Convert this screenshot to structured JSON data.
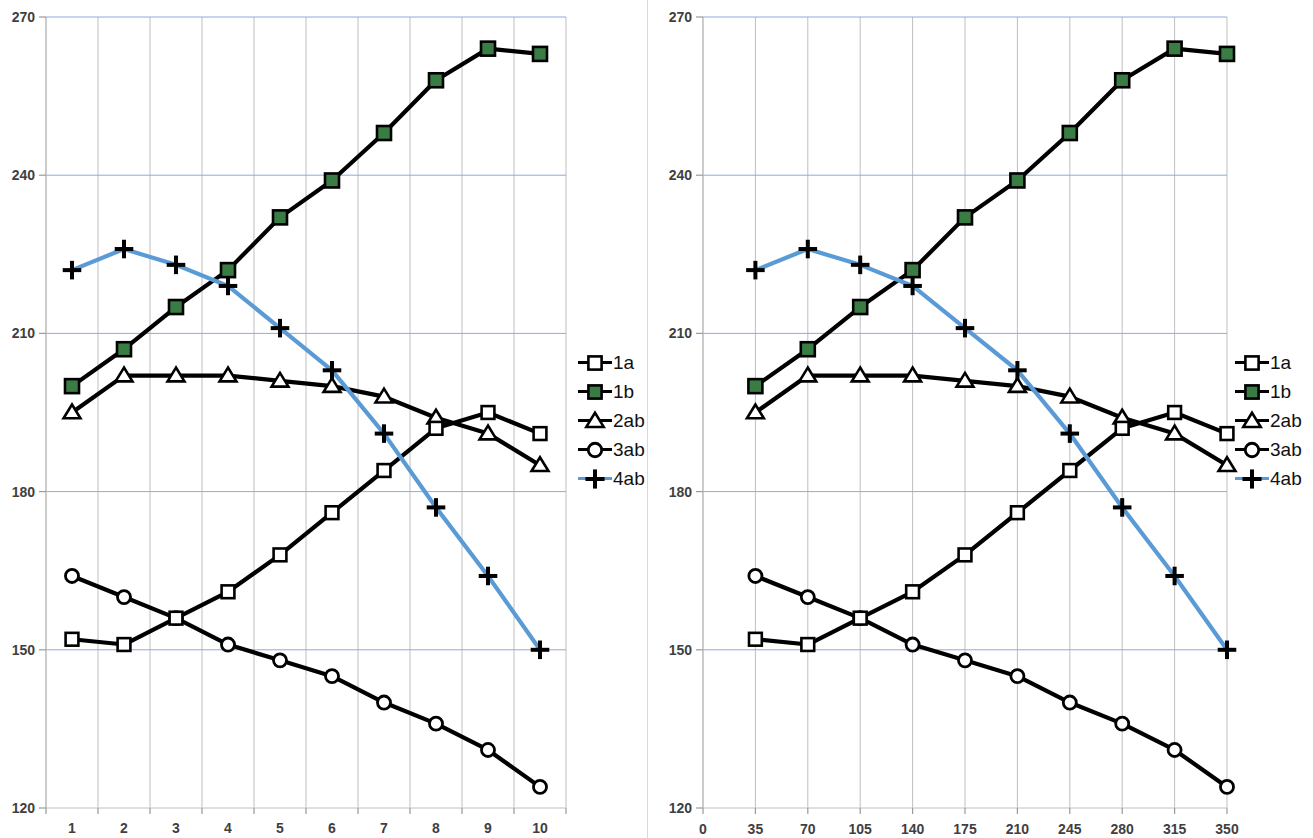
{
  "chart_data": [
    {
      "id": "left-chart",
      "type": "line",
      "title": "",
      "xlabel": "",
      "ylabel": "",
      "x_axis_type": "category",
      "categories": [
        "1",
        "2",
        "3",
        "4",
        "5",
        "6",
        "7",
        "8",
        "9",
        "10"
      ],
      "xtick_labels": [
        "1",
        "2",
        "3",
        "4",
        "5",
        "6",
        "7",
        "8",
        "9",
        "10"
      ],
      "xlim": [
        0.5,
        10.5
      ],
      "ylim": [
        120,
        270
      ],
      "ytick_labels": [
        "120",
        "150",
        "180",
        "210",
        "240",
        "270"
      ],
      "yticks": [
        120,
        150,
        180,
        210,
        240,
        270
      ],
      "grid": "both",
      "legend_position": "right",
      "series": [
        {
          "name": "1a",
          "marker": "open-square",
          "color": "#000000",
          "values": [
            152,
            151,
            156,
            161,
            168,
            176,
            184,
            192,
            195,
            191
          ]
        },
        {
          "name": "1b",
          "marker": "filled-square",
          "color": "#000000",
          "marker_fill": "#3a7d44",
          "values": [
            200,
            207,
            215,
            222,
            232,
            239,
            248,
            258,
            264,
            263
          ]
        },
        {
          "name": "2ab",
          "marker": "open-triangle",
          "color": "#000000",
          "values": [
            195,
            202,
            202,
            202,
            201,
            200,
            198,
            194,
            191,
            185
          ]
        },
        {
          "name": "3ab",
          "marker": "open-circle",
          "color": "#000000",
          "values": [
            164,
            160,
            156,
            151,
            148,
            145,
            140,
            136,
            131,
            124
          ]
        },
        {
          "name": "4ab",
          "marker": "plus",
          "color": "#5b9bd5",
          "values": [
            222,
            226,
            223,
            219,
            211,
            203,
            191,
            177,
            164,
            150
          ]
        }
      ]
    },
    {
      "id": "right-chart",
      "type": "line",
      "title": "",
      "xlabel": "",
      "ylabel": "",
      "x_axis_type": "numeric",
      "x": [
        35,
        70,
        105,
        140,
        175,
        210,
        245,
        280,
        315,
        350
      ],
      "xtick_labels": [
        "0",
        "35",
        "70",
        "105",
        "140",
        "175",
        "210",
        "245",
        "280",
        "315",
        "350"
      ],
      "xticks": [
        0,
        35,
        70,
        105,
        140,
        175,
        210,
        245,
        280,
        315,
        350
      ],
      "xlim": [
        0,
        350
      ],
      "ylim": [
        120,
        270
      ],
      "ytick_labels": [
        "120",
        "150",
        "180",
        "210",
        "240",
        "270"
      ],
      "yticks": [
        120,
        150,
        180,
        210,
        240,
        270
      ],
      "grid": "both",
      "legend_position": "right",
      "series": [
        {
          "name": "1a",
          "marker": "open-square",
          "color": "#000000",
          "values": [
            152,
            151,
            156,
            161,
            168,
            176,
            184,
            192,
            195,
            191
          ]
        },
        {
          "name": "1b",
          "marker": "filled-square",
          "color": "#000000",
          "marker_fill": "#3a7d44",
          "values": [
            200,
            207,
            215,
            222,
            232,
            239,
            248,
            258,
            264,
            263
          ]
        },
        {
          "name": "2ab",
          "marker": "open-triangle",
          "color": "#000000",
          "values": [
            195,
            202,
            202,
            202,
            201,
            200,
            198,
            194,
            191,
            185
          ]
        },
        {
          "name": "3ab",
          "marker": "open-circle",
          "color": "#000000",
          "values": [
            164,
            160,
            156,
            151,
            148,
            145,
            140,
            136,
            131,
            124
          ]
        },
        {
          "name": "4ab",
          "marker": "plus",
          "color": "#5b9bd5",
          "values": [
            222,
            226,
            223,
            219,
            211,
            203,
            191,
            177,
            164,
            150
          ]
        }
      ]
    }
  ],
  "legend": {
    "items": [
      {
        "label": "1a",
        "marker": "open-square",
        "line_color": "#000000"
      },
      {
        "label": "1b",
        "marker": "filled-square",
        "line_color": "#000000"
      },
      {
        "label": "2ab",
        "marker": "open-triangle",
        "line_color": "#000000"
      },
      {
        "label": "3ab",
        "marker": "open-circle",
        "line_color": "#000000"
      },
      {
        "label": "4ab",
        "marker": "plus",
        "line_color": "#5b9bd5"
      }
    ]
  },
  "colors": {
    "grid": "#bfbfbf",
    "major_grid": "#8faadc",
    "axis_text": "#3f3f3f",
    "series_black": "#000000",
    "series_blue": "#5b9bd5",
    "marker_green": "#3a7d44",
    "panel_divider": "#d9d9d9"
  }
}
